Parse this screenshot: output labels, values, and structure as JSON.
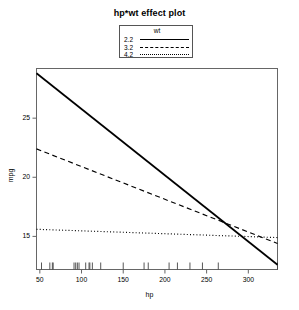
{
  "chart_data": {
    "type": "line",
    "title": "hp*wt effect plot",
    "xlabel": "hp",
    "ylabel": "mpg",
    "xlim": [
      46,
      335
    ],
    "ylim": [
      12.2,
      29.2
    ],
    "xticks": [
      50,
      100,
      150,
      200,
      250,
      300
    ],
    "yticks": [
      15,
      20,
      25
    ],
    "grid": false,
    "legend": {
      "title": "wt",
      "position": "top-center",
      "entries": [
        {
          "label": "2.2",
          "linestyle": "solid"
        },
        {
          "label": "3.2",
          "linestyle": "dashed"
        },
        {
          "label": "4.2",
          "linestyle": "dotted"
        }
      ]
    },
    "x": [
      46,
      335
    ],
    "series": [
      {
        "name": "2.2",
        "linestyle": "solid",
        "values": [
          28.8,
          12.6
        ]
      },
      {
        "name": "3.2",
        "linestyle": "dashed",
        "values": [
          22.4,
          14.4
        ]
      },
      {
        "name": "4.2",
        "linestyle": "dotted",
        "values": [
          15.6,
          14.9
        ]
      }
    ],
    "rug": [
      52,
      62,
      65,
      66,
      91,
      93,
      95,
      97,
      105,
      109,
      110,
      113,
      123,
      150,
      175,
      180,
      205,
      215,
      230,
      245,
      264,
      335
    ]
  }
}
